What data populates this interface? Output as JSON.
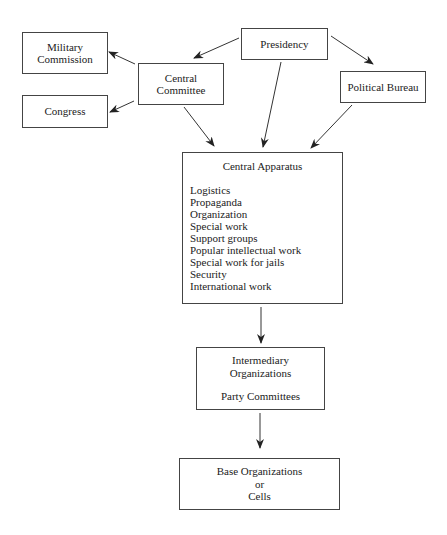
{
  "diagram": {
    "nodes": {
      "military_commission": {
        "lines": [
          "Military",
          "Commission"
        ]
      },
      "congress": {
        "lines": [
          "Congress"
        ]
      },
      "central_committee": {
        "lines": [
          "Central",
          "Committee"
        ]
      },
      "presidency": {
        "lines": [
          "Presidency"
        ]
      },
      "political_bureau": {
        "lines": [
          "Political Bureau"
        ]
      },
      "central_apparatus": {
        "title": "Central Apparatus",
        "items": [
          "Logistics",
          "Propaganda",
          "Organization",
          "Special work",
          "Support groups",
          "Popular intellectual work",
          "Special work for jails",
          "Security",
          "International work"
        ]
      },
      "intermediary": {
        "lines": [
          "Intermediary",
          "Organizations"
        ],
        "sub": "Party Committees"
      },
      "base": {
        "lines": [
          "Base Organizations",
          "or",
          "Cells"
        ]
      }
    },
    "edges": [
      {
        "from": "Presidency",
        "to": "Central Committee"
      },
      {
        "from": "Presidency",
        "to": "Political Bureau"
      },
      {
        "from": "Presidency",
        "to": "Central Apparatus"
      },
      {
        "from": "Central Committee",
        "to": "Military Commission"
      },
      {
        "from": "Central Committee",
        "to": "Congress"
      },
      {
        "from": "Central Committee",
        "to": "Central Apparatus"
      },
      {
        "from": "Political Bureau",
        "to": "Central Apparatus"
      },
      {
        "from": "Central Apparatus",
        "to": "Intermediary Organizations"
      },
      {
        "from": "Intermediary Organizations",
        "to": "Base Organizations or Cells"
      }
    ],
    "colors": {
      "stroke": "#333333",
      "background": "#ffffff"
    }
  }
}
